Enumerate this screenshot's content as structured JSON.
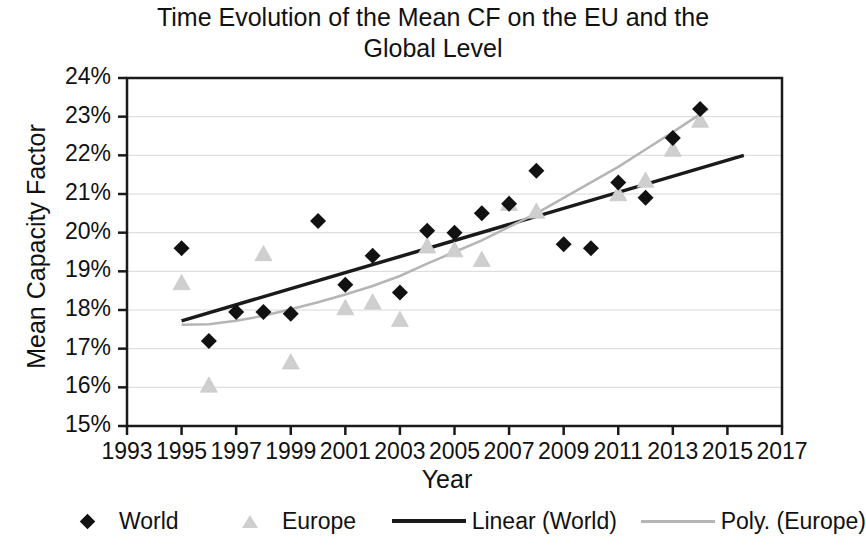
{
  "chart_data": {
    "type": "scatter",
    "title": "Time Evolution of the Mean CF on the EU and the Global Level",
    "title_line1": "Time Evolution of the Mean CF on the EU and the",
    "title_line2": "Global Level",
    "xlabel": "Year",
    "ylabel": "Mean Capacity Factor",
    "xlim": [
      1993,
      2017
    ],
    "ylim": [
      15,
      24
    ],
    "xtick_labels": [
      "1993",
      "1995",
      "1997",
      "1999",
      "2001",
      "2003",
      "2005",
      "2007",
      "2009",
      "2011",
      "2013",
      "2015",
      "2017"
    ],
    "xticks": [
      1993,
      1995,
      1997,
      1999,
      2001,
      2003,
      2005,
      2007,
      2009,
      2011,
      2013,
      2015,
      2017
    ],
    "ytick_labels": [
      "24%",
      "23%",
      "22%",
      "21%",
      "20%",
      "19%",
      "18%",
      "17%",
      "16%",
      "15%"
    ],
    "yticks": [
      24,
      23,
      22,
      21,
      20,
      19,
      18,
      17,
      16,
      15
    ],
    "grid": "horizontal",
    "legend_position": "bottom",
    "series": [
      {
        "name": "World",
        "marker": "diamond",
        "color": "#111111",
        "x": [
          1995,
          1996,
          1997,
          1998,
          1999,
          2000,
          2001,
          2002,
          2003,
          2004,
          2005,
          2006,
          2007,
          2008,
          2009,
          2010,
          2011,
          2012,
          2013,
          2014
        ],
        "y": [
          19.6,
          17.2,
          17.95,
          17.95,
          17.9,
          20.3,
          18.65,
          19.4,
          18.45,
          20.05,
          20.0,
          20.5,
          20.75,
          21.6,
          19.7,
          19.6,
          21.3,
          20.9,
          22.45,
          23.2
        ]
      },
      {
        "name": "Europe",
        "marker": "triangle",
        "color": "#cfcfcf",
        "x": [
          1995,
          1996,
          1998,
          1999,
          2001,
          2002,
          2003,
          2004,
          2005,
          2006,
          2007,
          2008,
          2011,
          2012,
          2013,
          2014
        ],
        "y": [
          18.7,
          16.05,
          19.45,
          16.65,
          18.05,
          18.2,
          17.75,
          19.65,
          19.55,
          19.3,
          20.75,
          20.55,
          21.0,
          21.35,
          22.15,
          22.9
        ]
      }
    ],
    "trendlines": [
      {
        "name": "Linear (World)",
        "type": "linear",
        "color": "#1a1a1a",
        "x_start": 1995,
        "x_end": 2015.6,
        "y_start": 17.72,
        "y_end": 22.0
      },
      {
        "name": "Poly. (Europe)",
        "type": "polynomial",
        "color": "#b5b5b5",
        "x_start": 1995,
        "x_end": 2014.3,
        "points": [
          [
            1995,
            17.62
          ],
          [
            1996,
            17.63
          ],
          [
            1997,
            17.72
          ],
          [
            1998,
            17.85
          ],
          [
            1999,
            18.02
          ],
          [
            2000,
            18.2
          ],
          [
            2001,
            18.4
          ],
          [
            2002,
            18.62
          ],
          [
            2003,
            18.88
          ],
          [
            2004,
            19.2
          ],
          [
            2005,
            19.5
          ],
          [
            2006,
            19.8
          ],
          [
            2007,
            20.15
          ],
          [
            2008,
            20.5
          ],
          [
            2009,
            20.9
          ],
          [
            2010,
            21.3
          ],
          [
            2011,
            21.7
          ],
          [
            2012,
            22.15
          ],
          [
            2013,
            22.6
          ],
          [
            2014.3,
            23.2
          ]
        ]
      }
    ]
  },
  "legend": {
    "items": [
      {
        "label": "World",
        "marker": "diamond-marker",
        "color": "#111111"
      },
      {
        "label": "Europe",
        "marker": "triangle-marker",
        "color": "#cfcfcf"
      },
      {
        "label": "Linear (World)",
        "marker": "line-marker",
        "color": "#1a1a1a"
      },
      {
        "label": "Poly. (Europe)",
        "marker": "line-marker",
        "color": "#b5b5b5"
      }
    ]
  }
}
